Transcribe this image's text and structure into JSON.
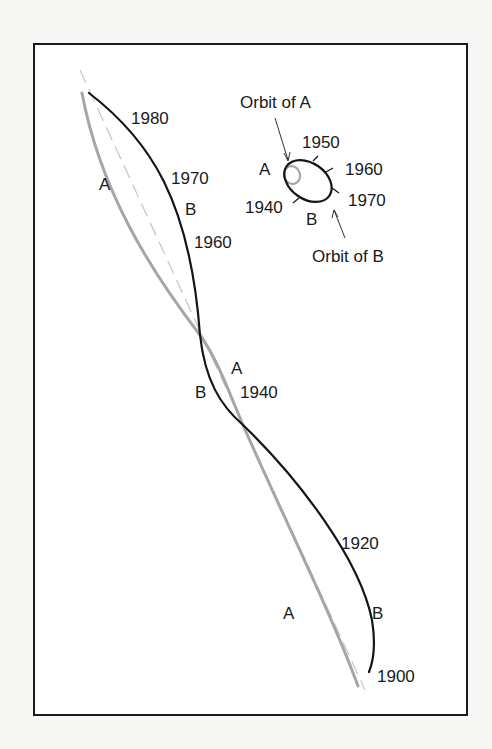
{
  "figure": {
    "colors": {
      "background": "#f7f7f5",
      "frame": "#1a1a1a",
      "star_a_path": "#a6a6a6",
      "star_b_path": "#151515",
      "center_of_mass_path": "#c8c8c8"
    }
  },
  "main_paths": {
    "star_a": {
      "name": "A",
      "labels": [
        {
          "text": "A",
          "position": "upper-left"
        },
        {
          "text": "A",
          "position": "middle"
        },
        {
          "text": "A",
          "position": "lower"
        }
      ]
    },
    "star_b": {
      "name": "B",
      "labels": [
        {
          "text": "B",
          "position": "upper"
        },
        {
          "text": "B",
          "position": "middle"
        },
        {
          "text": "B",
          "position": "lower"
        }
      ]
    },
    "year_labels": [
      "1980",
      "1970",
      "1960",
      "1940",
      "1920",
      "1900"
    ]
  },
  "inset_orbit": {
    "orbit_a_label": "Orbit of A",
    "orbit_b_label": "Orbit of B",
    "star_a_label": "A",
    "star_b_label": "B",
    "year_ticks": [
      "1940",
      "1950",
      "1960",
      "1970"
    ]
  }
}
